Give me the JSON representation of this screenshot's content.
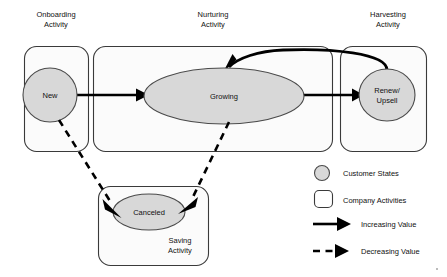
{
  "diagram": {
    "activities": [
      {
        "id": "onboarding",
        "label_line1": "Onboarding",
        "label_line2": "Activity"
      },
      {
        "id": "nurturing",
        "label_line1": "Nurturing",
        "label_line2": "Activity"
      },
      {
        "id": "harvesting",
        "label_line1": "Harvesting",
        "label_line2": "Activity"
      },
      {
        "id": "saving",
        "label_line1": "Saving",
        "label_line2": "Activity"
      }
    ],
    "states": [
      {
        "id": "new",
        "label_line1": "New",
        "label_line2": ""
      },
      {
        "id": "growing",
        "label_line1": "Growing",
        "label_line2": ""
      },
      {
        "id": "renew-upsell",
        "label_line1": "Renew/",
        "label_line2": "Upsell"
      },
      {
        "id": "canceled",
        "label_line1": "Canceled",
        "label_line2": ""
      }
    ],
    "edges": [
      {
        "id": "new-to-growing",
        "from": "new",
        "to": "growing",
        "kind": "increasing"
      },
      {
        "id": "growing-to-renew",
        "from": "growing",
        "to": "renew-upsell",
        "kind": "increasing"
      },
      {
        "id": "renew-to-growing",
        "from": "renew-upsell",
        "to": "growing",
        "kind": "increasing"
      },
      {
        "id": "new-to-canceled",
        "from": "new",
        "to": "canceled",
        "kind": "decreasing"
      },
      {
        "id": "growing-to-canceled",
        "from": "growing",
        "to": "canceled",
        "kind": "decreasing"
      }
    ]
  },
  "legend": {
    "items": [
      {
        "id": "customer-states",
        "label": "Customer States",
        "symbol": "circle"
      },
      {
        "id": "company-activities",
        "label": "Company Activities",
        "symbol": "rounded-square"
      },
      {
        "id": "increasing-value",
        "label": "Increasing Value",
        "symbol": "solid-arrow"
      },
      {
        "id": "decreasing-value",
        "label": "Decreasing Value",
        "symbol": "dashed-arrow"
      }
    ]
  },
  "colors": {
    "state_fill": "#d8d8d8",
    "activity_fill": "#fbfbfb",
    "stroke": "#3a3a3a",
    "arrow": "#000000",
    "text": "#111111",
    "background": "#ffffff"
  }
}
